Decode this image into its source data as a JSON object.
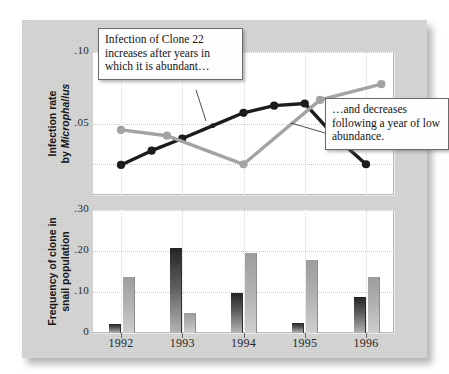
{
  "figure": {
    "background_color": "#d3d3d2",
    "panel_color": "#ffffff"
  },
  "annotations": [
    {
      "id": "callout-1",
      "text": "Infection of Clone 22 increases after years in which it is abundant…"
    },
    {
      "id": "callout-2",
      "text": "…and decreases following a year of low abundance."
    }
  ],
  "axes": {
    "x_tick_labels": [
      "1992",
      "1993",
      "1994",
      "1995",
      "1996"
    ],
    "top_y_tick_labels": [
      ".10",
      ".05"
    ],
    "bottom_y_tick_labels": [
      ".30",
      ".20",
      ".10",
      "0"
    ],
    "top_y_title_line1": "Infection rate",
    "top_y_title_line2_prefix": "by ",
    "top_y_title_line2_italic": "Microphallus",
    "bottom_y_title_line1": "Frequency of clone in",
    "bottom_y_title_line2": "snail population"
  },
  "chart_data": [
    {
      "type": "line",
      "title": "Infection rate by Microphallus",
      "xlabel": "",
      "ylabel": "Infection rate by Microphallus",
      "ylim": [
        0.0,
        0.1
      ],
      "xlim": [
        1991.75,
        1996.5
      ],
      "ytick_values": [
        0.1,
        0.05
      ],
      "grid": true,
      "legend": "none",
      "series": [
        {
          "name": "Clone 22 infection rate (dark)",
          "color": "#1c1c1c",
          "marker": "circle",
          "x": [
            1992.0,
            1992.5,
            1993.0,
            1993.5,
            1994.0,
            1994.5,
            1995.0,
            1995.5,
            1996.0
          ],
          "y": [
            0.021,
            0.031,
            0.0395,
            0.0485,
            0.0575,
            0.0625,
            0.064,
            0.0405,
            0.0215
          ]
        },
        {
          "name": "Clone 22 frequency-linked rate (light)",
          "color": "#a3a3a3",
          "marker": "circle",
          "x": [
            1992.0,
            1992.75,
            1994.0,
            1995.25,
            1996.25
          ],
          "y": [
            0.0455,
            0.0415,
            0.0215,
            0.0665,
            0.0775
          ]
        }
      ]
    },
    {
      "type": "bar",
      "title": "Frequency of clone in snail population",
      "xlabel": "",
      "ylabel": "Frequency of clone in snail population",
      "ylim": [
        0.0,
        0.3
      ],
      "ytick_values": [
        0.3,
        0.2,
        0.1,
        0.0
      ],
      "grid": true,
      "categories": [
        "1992",
        "1993",
        "1994",
        "1995",
        "1996"
      ],
      "series": [
        {
          "name": "Clone 22 (dark bar)",
          "color": "#3a3a3a",
          "values": [
            0.023,
            0.207,
            0.097,
            0.024,
            0.087
          ]
        },
        {
          "name": "Other clone (light bar)",
          "color": "#adadad",
          "values": [
            0.137,
            0.05,
            0.194,
            0.178,
            0.137
          ]
        }
      ]
    }
  ]
}
